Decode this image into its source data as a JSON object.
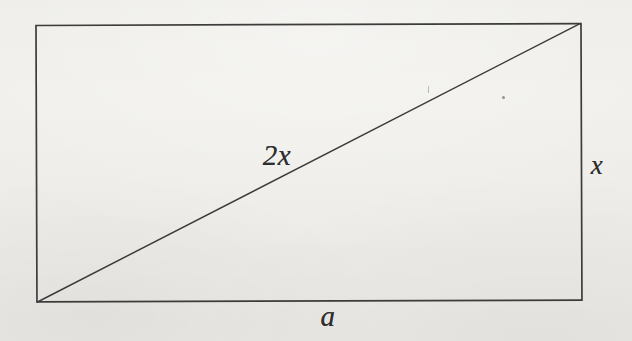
{
  "colors": {
    "paper": "#f0efeb",
    "ink": "#3c3c3c",
    "label-ink": "#2e2e2e"
  },
  "figure": {
    "type": "rectangle-with-diagonal",
    "labels": {
      "diagonal": "2x",
      "right_side": "x",
      "bottom_side": "a"
    }
  }
}
